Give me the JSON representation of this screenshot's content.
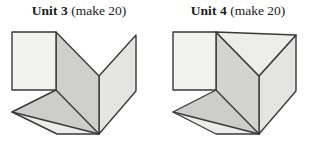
{
  "page": {
    "background_color": "#ffffff",
    "width": 317,
    "height": 156
  },
  "palette": {
    "stroke": "#3a3a3a",
    "face_white": "#f2f2f1",
    "face_light": "#e9e9e8",
    "face_mid": "#dcdcdb",
    "face_gray": "#cfcfce",
    "face_dark": "#c4c4c3",
    "text": "#1a1a1a"
  },
  "units": [
    {
      "id": "unit-3",
      "title_bold": "Unit 3",
      "title_plain": "(make 20)",
      "description": "open V-fold polyhedral net with square front face and extended foot",
      "faces": [
        {
          "name": "front-square",
          "fill": "#f2f2f1"
        },
        {
          "name": "inner-left-panel",
          "fill": "#cfcfce"
        },
        {
          "name": "right-wing-panel",
          "fill": "#e4e4e3"
        },
        {
          "name": "lower-left-trapezoid",
          "fill": "#cdcdcc"
        },
        {
          "name": "bottom-foot",
          "fill": "#ececeb"
        }
      ]
    },
    {
      "id": "unit-4",
      "title_bold": "Unit 4",
      "title_plain": "(make 20)",
      "description": "closed V-fold polyhedral net with filled notch triangle and extended foot",
      "faces": [
        {
          "name": "front-square",
          "fill": "#f2f2f1"
        },
        {
          "name": "notch-triangle",
          "fill": "#ededec"
        },
        {
          "name": "inner-left-panel",
          "fill": "#d3d3d2"
        },
        {
          "name": "right-wing-panel",
          "fill": "#e4e4e3"
        },
        {
          "name": "lower-left-trapezoid",
          "fill": "#cdcdcc"
        },
        {
          "name": "bottom-foot",
          "fill": "#ececeb"
        }
      ]
    }
  ]
}
